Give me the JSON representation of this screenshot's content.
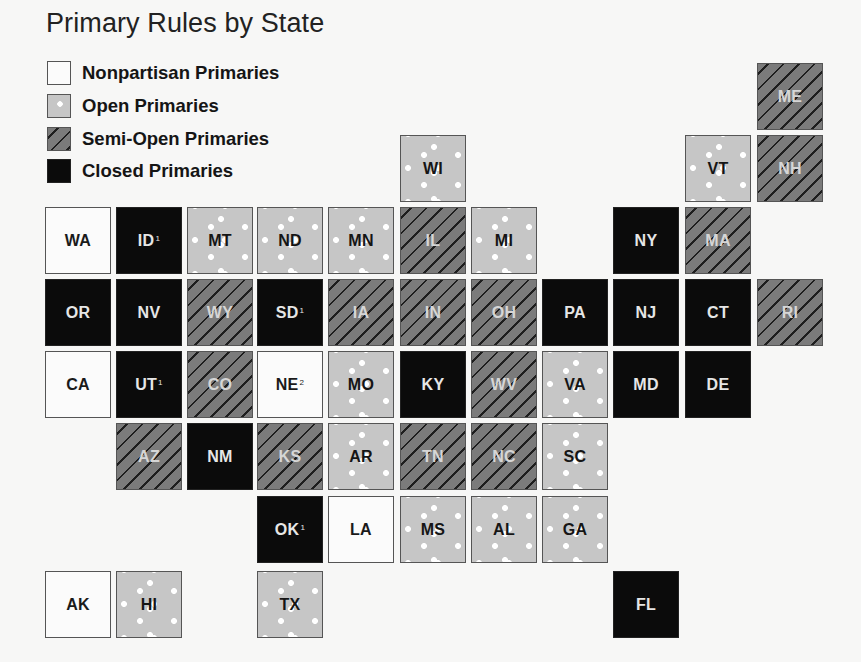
{
  "chart_data": {
    "type": "tile-grid-map",
    "title": "Primary Rules by State",
    "legend": [
      {
        "key": "nonpartisan",
        "label": "Nonpartisan Primaries",
        "fill": "#fbfbfb",
        "pattern": "solid"
      },
      {
        "key": "open",
        "label": "Open Primaries",
        "fill": "#c6c6c6",
        "pattern": "white-dots"
      },
      {
        "key": "semi",
        "label": "Semi-Open Primaries",
        "fill": "#7b7b7b",
        "pattern": "diagonal-stripes"
      },
      {
        "key": "closed",
        "label": "Closed Primaries",
        "fill": "#0b0b0b",
        "pattern": "solid"
      }
    ],
    "states": [
      {
        "abbr": "ME",
        "col": 10,
        "row": 0,
        "category": "semi",
        "note": ""
      },
      {
        "abbr": "WI",
        "col": 5,
        "row": 1,
        "category": "open",
        "note": ""
      },
      {
        "abbr": "VT",
        "col": 9,
        "row": 1,
        "category": "open",
        "note": ""
      },
      {
        "abbr": "NH",
        "col": 10,
        "row": 1,
        "category": "semi",
        "note": ""
      },
      {
        "abbr": "WA",
        "col": 0,
        "row": 2,
        "category": "nonpartisan",
        "note": ""
      },
      {
        "abbr": "ID",
        "col": 1,
        "row": 2,
        "category": "closed",
        "note": "1"
      },
      {
        "abbr": "MT",
        "col": 2,
        "row": 2,
        "category": "open",
        "note": ""
      },
      {
        "abbr": "ND",
        "col": 3,
        "row": 2,
        "category": "open",
        "note": ""
      },
      {
        "abbr": "MN",
        "col": 4,
        "row": 2,
        "category": "open",
        "note": ""
      },
      {
        "abbr": "IL",
        "col": 5,
        "row": 2,
        "category": "semi",
        "note": ""
      },
      {
        "abbr": "MI",
        "col": 6,
        "row": 2,
        "category": "open",
        "note": ""
      },
      {
        "abbr": "NY",
        "col": 8,
        "row": 2,
        "category": "closed",
        "note": ""
      },
      {
        "abbr": "MA",
        "col": 9,
        "row": 2,
        "category": "semi",
        "note": ""
      },
      {
        "abbr": "OR",
        "col": 0,
        "row": 3,
        "category": "closed",
        "note": ""
      },
      {
        "abbr": "NV",
        "col": 1,
        "row": 3,
        "category": "closed",
        "note": ""
      },
      {
        "abbr": "WY",
        "col": 2,
        "row": 3,
        "category": "semi",
        "note": ""
      },
      {
        "abbr": "SD",
        "col": 3,
        "row": 3,
        "category": "closed",
        "note": "1"
      },
      {
        "abbr": "IA",
        "col": 4,
        "row": 3,
        "category": "semi",
        "note": ""
      },
      {
        "abbr": "IN",
        "col": 5,
        "row": 3,
        "category": "semi",
        "note": ""
      },
      {
        "abbr": "OH",
        "col": 6,
        "row": 3,
        "category": "semi",
        "note": ""
      },
      {
        "abbr": "PA",
        "col": 7,
        "row": 3,
        "category": "closed",
        "note": ""
      },
      {
        "abbr": "NJ",
        "col": 8,
        "row": 3,
        "category": "closed",
        "note": ""
      },
      {
        "abbr": "CT",
        "col": 9,
        "row": 3,
        "category": "closed",
        "note": ""
      },
      {
        "abbr": "RI",
        "col": 10,
        "row": 3,
        "category": "semi",
        "note": ""
      },
      {
        "abbr": "CA",
        "col": 0,
        "row": 4,
        "category": "nonpartisan",
        "note": ""
      },
      {
        "abbr": "UT",
        "col": 1,
        "row": 4,
        "category": "closed",
        "note": "1"
      },
      {
        "abbr": "CO",
        "col": 2,
        "row": 4,
        "category": "semi",
        "note": ""
      },
      {
        "abbr": "NE",
        "col": 3,
        "row": 4,
        "category": "nonpartisan",
        "note": "2"
      },
      {
        "abbr": "MO",
        "col": 4,
        "row": 4,
        "category": "open",
        "note": ""
      },
      {
        "abbr": "KY",
        "col": 5,
        "row": 4,
        "category": "closed",
        "note": ""
      },
      {
        "abbr": "WV",
        "col": 6,
        "row": 4,
        "category": "semi",
        "note": ""
      },
      {
        "abbr": "VA",
        "col": 7,
        "row": 4,
        "category": "open",
        "note": ""
      },
      {
        "abbr": "MD",
        "col": 8,
        "row": 4,
        "category": "closed",
        "note": ""
      },
      {
        "abbr": "DE",
        "col": 9,
        "row": 4,
        "category": "closed",
        "note": ""
      },
      {
        "abbr": "AZ",
        "col": 1,
        "row": 5,
        "category": "semi",
        "note": ""
      },
      {
        "abbr": "NM",
        "col": 2,
        "row": 5,
        "category": "closed",
        "note": ""
      },
      {
        "abbr": "KS",
        "col": 3,
        "row": 5,
        "category": "semi",
        "note": ""
      },
      {
        "abbr": "AR",
        "col": 4,
        "row": 5,
        "category": "open",
        "note": ""
      },
      {
        "abbr": "TN",
        "col": 5,
        "row": 5,
        "category": "semi",
        "note": ""
      },
      {
        "abbr": "NC",
        "col": 6,
        "row": 5,
        "category": "semi",
        "note": ""
      },
      {
        "abbr": "SC",
        "col": 7,
        "row": 5,
        "category": "open",
        "note": ""
      },
      {
        "abbr": "OK",
        "col": 3,
        "row": 6,
        "category": "closed",
        "note": "1"
      },
      {
        "abbr": "LA",
        "col": 4,
        "row": 6,
        "category": "nonpartisan",
        "note": ""
      },
      {
        "abbr": "MS",
        "col": 5,
        "row": 6,
        "category": "open",
        "note": ""
      },
      {
        "abbr": "AL",
        "col": 6,
        "row": 6,
        "category": "open",
        "note": ""
      },
      {
        "abbr": "GA",
        "col": 7,
        "row": 6,
        "category": "open",
        "note": ""
      },
      {
        "abbr": "AK",
        "col": 0,
        "row": 7,
        "category": "nonpartisan",
        "note": ""
      },
      {
        "abbr": "HI",
        "col": 1,
        "row": 7,
        "category": "open",
        "note": ""
      },
      {
        "abbr": "TX",
        "col": 3,
        "row": 7,
        "category": "open",
        "note": ""
      },
      {
        "abbr": "FL",
        "col": 8,
        "row": 7,
        "category": "closed",
        "note": ""
      }
    ],
    "counts": {
      "nonpartisan": 5,
      "open": 17,
      "semi": 15,
      "closed": 13
    }
  }
}
